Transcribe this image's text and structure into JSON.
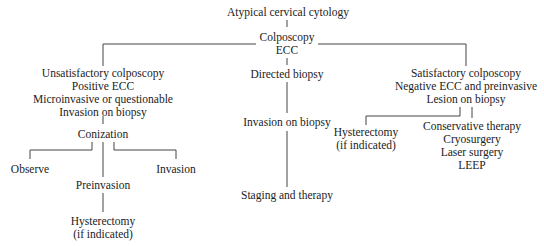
{
  "diagram": {
    "root": "Atypical cervical cytology",
    "colposcopy": [
      "Colposcopy",
      "ECC"
    ],
    "left_branch": {
      "criteria": [
        "Unsatisfactory colposcopy",
        "Positive ECC",
        "Microinvasive or questionable",
        "Invasion on biopsy"
      ],
      "conization": "Conization",
      "observe": "Observe",
      "invasion": "Invasion",
      "preinvasion": "Preinvasion",
      "hysterectomy": [
        "Hysterectomy",
        "(if indicated)"
      ]
    },
    "middle_branch": {
      "directed_biopsy": "Directed biopsy",
      "invasion_on_biopsy": "Invasion on biopsy",
      "staging": "Staging and therapy"
    },
    "right_branch": {
      "criteria": [
        "Satisfactory colposcopy",
        "Negative ECC and preinvasive",
        "Lesion on biopsy"
      ],
      "hysterectomy": [
        "Hysterectomy",
        "(if indicated)"
      ],
      "conservative": [
        "Conservative therapy",
        "Cryosurgery",
        "Laser surgery",
        "LEEP"
      ]
    }
  }
}
